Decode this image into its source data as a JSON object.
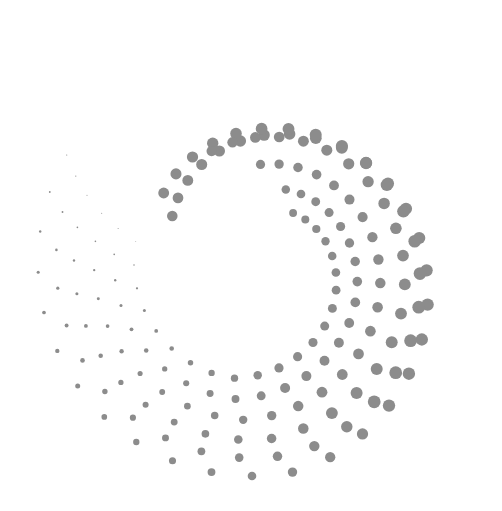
{
  "graphic": {
    "name": "halftone-dot-spiral",
    "background": "#ffffff",
    "dot_color": "#8c8c8c",
    "width": 502,
    "height": 511,
    "center": [
      252,
      262
    ],
    "arms": [
      {
        "r_start": 92,
        "r_end": 214,
        "angle_start": -60,
        "angle_end": 300,
        "dots": 34,
        "size_start": 6.2,
        "size_end": 0.6
      },
      {
        "r_start": 112,
        "r_end": 196,
        "angle_start": -52,
        "angle_end": 296,
        "dots": 32,
        "size_start": 6.4,
        "size_end": 0.6
      },
      {
        "r_start": 118,
        "r_end": 178,
        "angle_start": -20,
        "angle_end": 292,
        "dots": 30,
        "size_start": 6.0,
        "size_end": 0.5
      },
      {
        "r_start": 98,
        "r_end": 158,
        "angle_start": 5,
        "angle_end": 288,
        "dots": 28,
        "size_start": 5.4,
        "size_end": 0.5
      },
      {
        "r_start": 80,
        "r_end": 138,
        "angle_start": 25,
        "angle_end": 284,
        "dots": 25,
        "size_start": 5.0,
        "size_end": 0.5
      },
      {
        "r_start": 64,
        "r_end": 118,
        "angle_start": 40,
        "angle_end": 280,
        "dots": 22,
        "size_start": 4.6,
        "size_end": 0.4
      }
    ]
  }
}
